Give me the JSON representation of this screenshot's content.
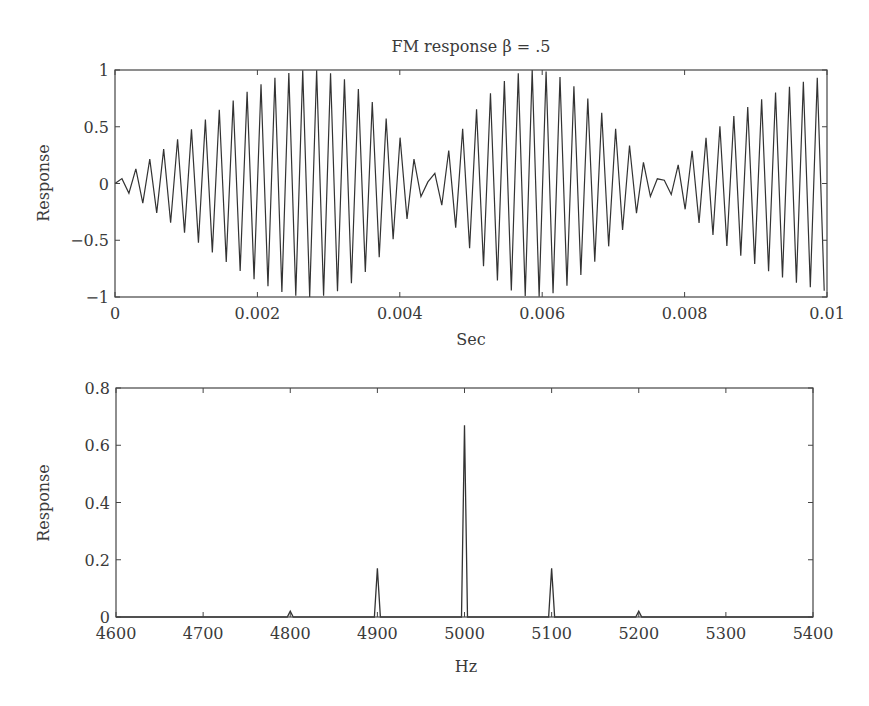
{
  "chart_data": [
    {
      "type": "line",
      "title": "FM response β = .5",
      "xlabel": "Sec",
      "ylabel": "Response",
      "xlim": [
        0,
        0.01
      ],
      "ylim": [
        -1,
        1
      ],
      "x_ticks": [
        "0",
        "0.002",
        "0.004",
        "0.006",
        "0.008",
        "0.01"
      ],
      "y_ticks": [
        "1",
        "0.5",
        "0",
        "−0.5",
        "−1"
      ],
      "grid": false,
      "signal": {
        "description": "FM signal: sin(2π·fc·t + β·sin(2π·fm·t))",
        "carrier_hz": 5000,
        "modulation_hz": 100,
        "beta": 0.5,
        "sample_rate_hz": 10240,
        "duration_s": 0.01
      }
    },
    {
      "type": "line",
      "title": "",
      "xlabel": "Hz",
      "ylabel": "Response",
      "xlim": [
        4600,
        5400
      ],
      "ylim": [
        0,
        0.8
      ],
      "x_ticks": [
        "4600",
        "4700",
        "4800",
        "4900",
        "5000",
        "5100",
        "5200",
        "5300",
        "5400"
      ],
      "y_ticks": [
        "0.8",
        "0.6",
        "0.4",
        "0.2",
        "0"
      ],
      "grid": false,
      "x": [
        4800,
        4900,
        5000,
        5100,
        5200
      ],
      "values": [
        0.02,
        0.17,
        0.67,
        0.17,
        0.02
      ]
    }
  ]
}
